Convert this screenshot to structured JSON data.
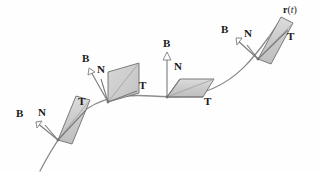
{
  "figure": {
    "background_color": "#fefefe",
    "curve": {
      "label_r": "r",
      "label_open_paren": "(",
      "label_param": "t",
      "label_close_paren": ")",
      "color": "#8c8c8c",
      "path": "M 40,171 C 52,148 64,128 80,114 C 100,97 124,94 152,96 C 178,98 196,96 214,88 C 238,77 252,60 268,38"
    },
    "style": {
      "plane_fill": "#c9c9c9",
      "plane_fill_light": "#d6d6d6",
      "plane_stroke": "#6e6e6e",
      "arrow_stroke": "#7a7a7a",
      "label_color": "#1a1a1a"
    },
    "frames": [
      {
        "name": "frame-1",
        "origin_x": 58,
        "origin_y": 140,
        "plane_points": "58,140 76,96 90,100 72,144",
        "plane_points_light": "58,140 72,144 90,100 76,96",
        "arrows": [
          {
            "name": "tangent-arrow",
            "label": "T",
            "x1": 58,
            "y1": 140,
            "x2": 86,
            "y2": 110,
            "head": "none",
            "label_x": 78,
            "label_y": 101
          },
          {
            "name": "normal-arrow",
            "label": "N",
            "x1": 58,
            "y1": 140,
            "x2": 44,
            "y2": 124,
            "head": "none",
            "label_x": 43,
            "label_y": 112
          },
          {
            "name": "binormal-arrow",
            "label": "B",
            "x1": 58,
            "y1": 140,
            "x2": 33,
            "y2": 120,
            "head": "hollow",
            "label_x": 16,
            "label_y": 113
          }
        ]
      },
      {
        "name": "frame-2",
        "origin_x": 108,
        "origin_y": 102,
        "plane_points": "108,102 108,72 138,64 138,94",
        "plane_points_light": "108,102 138,94 138,64 108,72",
        "arrows": [
          {
            "name": "tangent-arrow",
            "label": "T",
            "x1": 108,
            "y1": 102,
            "x2": 136,
            "y2": 90,
            "head": "none",
            "label_x": 139,
            "label_y": 85
          },
          {
            "name": "normal-arrow",
            "label": "N",
            "x1": 108,
            "y1": 102,
            "x2": 100,
            "y2": 78,
            "head": "none",
            "label_x": 98,
            "label_y": 70
          },
          {
            "name": "binormal-arrow",
            "label": "B",
            "x1": 108,
            "y1": 102,
            "x2": 87,
            "y2": 68,
            "head": "hollow",
            "label_x": 83,
            "label_y": 58
          }
        ]
      },
      {
        "name": "frame-3",
        "origin_x": 167,
        "origin_y": 97,
        "plane_points": "167,97 179,80 213,80 203,97",
        "plane_points_light": "167,97 203,97 213,80 179,80",
        "arrows": [
          {
            "name": "tangent-arrow",
            "label": "T",
            "x1": 167,
            "y1": 97,
            "x2": 203,
            "y2": 97,
            "head": "none",
            "label_x": 204,
            "label_y": 98
          },
          {
            "name": "normal-arrow",
            "label": "N",
            "x1": 167,
            "y1": 97,
            "x2": 179,
            "y2": 80,
            "head": "none",
            "label_x": 175,
            "label_y": 66
          },
          {
            "name": "binormal-arrow",
            "label": "B",
            "x1": 167,
            "y1": 97,
            "x2": 167,
            "y2": 53,
            "head": "hollow",
            "label_x": 163,
            "label_y": 42
          }
        ]
      },
      {
        "name": "frame-4",
        "origin_x": 258,
        "origin_y": 59,
        "plane_points": "258,59 281,18 293,24 270,64",
        "plane_points_light": "258,59 270,64 293,24 281,18",
        "arrows": [
          {
            "name": "tangent-arrow",
            "label": "T",
            "x1": 258,
            "y1": 59,
            "x2": 288,
            "y2": 30,
            "head": "none",
            "label_x": 286,
            "label_y": 32
          },
          {
            "name": "normal-arrow",
            "label": "N",
            "x1": 258,
            "y1": 59,
            "x2": 246,
            "y2": 44,
            "head": "none",
            "label_x": 245,
            "label_y": 31
          },
          {
            "name": "binormal-arrow",
            "label": "B",
            "x1": 258,
            "y1": 59,
            "x2": 234,
            "y2": 38,
            "head": "hollow",
            "label_x": 222,
            "label_y": 28
          }
        ]
      }
    ],
    "curve_label_pos": {
      "x": 283,
      "y": 6
    }
  }
}
